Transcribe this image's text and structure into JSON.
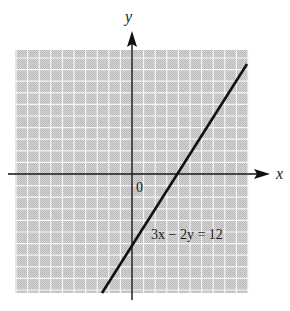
{
  "chart_data": {
    "type": "line",
    "title": "",
    "xlabel": "x",
    "ylabel": "y",
    "origin_label": "0",
    "grid": true,
    "grid_color": "#c8c8c8",
    "grid_line_color": "#f4f4f4",
    "line_color": "#111111",
    "equation_label": "3x − 2y = 12",
    "series": [
      {
        "name": "3x − 2y = 12",
        "x": [
          -2,
          8
        ],
        "y": [
          -9,
          6
        ]
      }
    ],
    "intercepts": {
      "x_intercept": 4,
      "y_intercept": -6
    },
    "xlim": [
      -10.5,
      10.5
    ],
    "ylim": [
      -10.5,
      11
    ]
  }
}
